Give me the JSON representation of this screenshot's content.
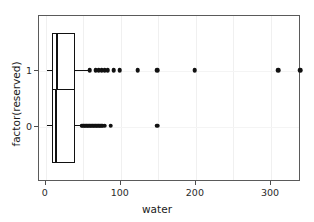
{
  "chart_data": {
    "type": "boxplot",
    "title": "",
    "xlabel": "water",
    "ylabel": "factor(reserved)",
    "orientation": "horizontal",
    "xlim": [
      -9,
      340
    ],
    "xticks": [
      0,
      100,
      200,
      300
    ],
    "xticklabels": [
      "0",
      "100",
      "200",
      "300"
    ],
    "yticklabels": [
      "1",
      "0"
    ],
    "grid": "faint vertical gridlines only",
    "legend": "none",
    "point_color": "#111111",
    "box_fill": "#ffffff",
    "box_line_color": "#111111",
    "panel_border_color": "#5a5a5a",
    "groups": [
      {
        "name": "1",
        "y_value": 1,
        "q1": 9,
        "median": 16,
        "q3": 40,
        "whisker_low": 3,
        "whisker_high": 57,
        "outliers": [
          60,
          68,
          72,
          76,
          80,
          84,
          92,
          100,
          124,
          150,
          200,
          311,
          340
        ]
      },
      {
        "name": "0",
        "y_value": 0,
        "q1": 9,
        "median": 15,
        "q3": 40,
        "whisker_low": 3,
        "whisker_high": 48,
        "outliers": [
          49,
          51,
          53,
          55,
          57,
          59,
          61,
          63,
          65,
          67,
          69,
          71,
          73,
          75,
          77,
          80,
          88,
          150
        ]
      }
    ]
  },
  "axis": {
    "x_title": "water",
    "y_title": "factor(reserved)",
    "x_tick_labels": [
      "0",
      "100",
      "200",
      "300"
    ],
    "y_tick_labels": [
      "1",
      "0"
    ]
  }
}
